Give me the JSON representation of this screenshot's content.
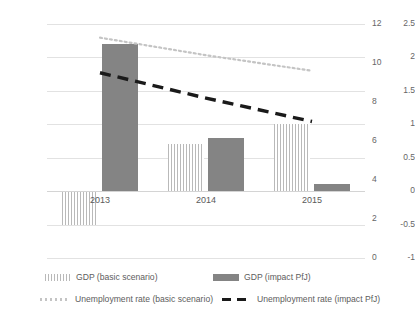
{
  "chart_data": {
    "type": "bar",
    "title": "",
    "subtitle": "",
    "xlabel": "",
    "ylabel": "",
    "categories": [
      "2013",
      "2014",
      "2015"
    ],
    "grid": true,
    "legend_position": "bottom",
    "axes": {
      "left": {
        "label": "",
        "ylim": [
          -1,
          2.5
        ],
        "ticks": [
          "2.5",
          "2",
          "1.5",
          "1",
          "0.5",
          "0",
          "-0.5",
          "-1"
        ],
        "tick_values": [
          2.5,
          2,
          1.5,
          1,
          0.5,
          0,
          -0.5,
          -1
        ]
      },
      "right": {
        "label": "",
        "ylim": [
          0,
          12
        ],
        "ticks": [
          "12",
          "10",
          "8",
          "6",
          "4",
          "2",
          "0"
        ],
        "tick_values": [
          12,
          10,
          8,
          6,
          4,
          2,
          0
        ]
      }
    },
    "series": [
      {
        "name": "GDP (basic scenario)",
        "kind": "bar",
        "style": "hatched",
        "axis": "left",
        "color": "#b9b9b9",
        "values": [
          -0.5,
          0.7,
          1.0
        ]
      },
      {
        "name": "GDP (impact PfJ)",
        "kind": "bar",
        "style": "solid",
        "axis": "left",
        "color": "#848484",
        "values": [
          2.2,
          0.8,
          0.1
        ]
      },
      {
        "name": "Unemployment rate (basic scenario)",
        "kind": "line",
        "style": "dotted",
        "axis": "right",
        "color": "#c4c4c4",
        "values": [
          11.3,
          10.4,
          9.6
        ]
      },
      {
        "name": "Unemployment rate (impact PfJ)",
        "kind": "line",
        "style": "dashed",
        "axis": "right",
        "color": "#1a1a1a",
        "values": [
          9.5,
          8.2,
          7.0
        ]
      }
    ]
  },
  "legend": {
    "items": [
      {
        "label": "GDP (basic scenario)",
        "marker": "hatch-swatch"
      },
      {
        "label": "GDP (impact PfJ)",
        "marker": "solid-swatch"
      },
      {
        "label": "Unemployment rate (basic scenario)",
        "marker": "dotted-line-swatch"
      },
      {
        "label": "Unemployment rate (impact PfJ)",
        "marker": "dashed-line-swatch"
      }
    ]
  }
}
